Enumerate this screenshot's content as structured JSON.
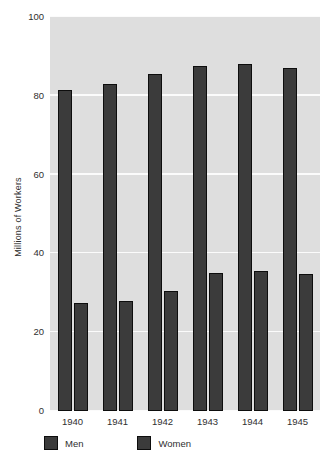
{
  "chart_data": {
    "type": "bar",
    "title": "",
    "subtitle": "",
    "xlabel": "",
    "ylabel": "Millions of Workers",
    "categories": [
      "1940",
      "1941",
      "1942",
      "1943",
      "1944",
      "1945"
    ],
    "series": [
      {
        "name": "Men",
        "values": [
          81.5,
          83.0,
          85.5,
          87.5,
          88.0,
          87.0
        ]
      },
      {
        "name": "Women",
        "values": [
          27.5,
          28.0,
          30.5,
          35.0,
          35.5,
          34.8
        ]
      }
    ],
    "ylim": [
      0,
      100
    ],
    "yticks": [
      0,
      20,
      40,
      60,
      80,
      100
    ],
    "ytick_labels": [
      "0",
      "20",
      "40",
      "60",
      "80",
      "100"
    ],
    "grid": true,
    "grid_axis": "y",
    "legend_position": "below-axis-left",
    "bar_color": "#3b3b3b",
    "bar_edge_color": "#0d0d0d",
    "plot_background": "#dedede",
    "gridline_color": "#fbfbfb",
    "figure_background": "#ffffff"
  },
  "legend": {
    "entries": [
      {
        "label": "Men"
      },
      {
        "label": "Women"
      }
    ]
  },
  "caption": {
    "text": ""
  }
}
